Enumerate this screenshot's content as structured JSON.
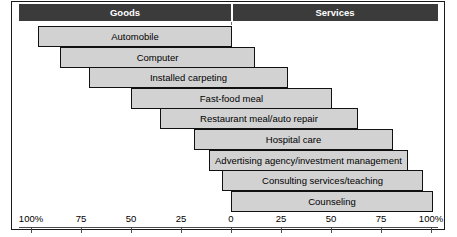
{
  "header": {
    "left_label": "Goods",
    "right_label": "Services"
  },
  "chart_data": {
    "type": "bar",
    "title": "",
    "subtitle": "",
    "xlabel": "",
    "ylabel": "",
    "orientation": "horizontal-diverging",
    "grid": false,
    "legend_position": "top",
    "legend": [
      "Goods",
      "Services"
    ],
    "axis": {
      "left_axis_label": "Goods",
      "right_axis_label": "Services",
      "tick_labels": [
        "100%",
        "75",
        "50",
        "25",
        "0",
        "25",
        "50",
        "75",
        "100%"
      ],
      "tick_values": [
        -100,
        -75,
        -50,
        -25,
        0,
        25,
        50,
        75,
        100
      ],
      "xlim": [
        -100,
        100
      ],
      "zero_position": 0
    },
    "categories": [
      "Automobile",
      "Computer",
      "Installed carpeting",
      "Fast-food meal",
      "Restaurant meal/auto repair",
      "Hospital care",
      "Advertising agency/investment management",
      "Consulting services/teaching",
      "Counseling"
    ],
    "series": [
      {
        "name": "Goods",
        "values": [
          96.5,
          85.5,
          71,
          50,
          35.5,
          18.5,
          11,
          4.5,
          0
        ]
      },
      {
        "name": "Services",
        "values": [
          3.5,
          14.5,
          29,
          50,
          64.5,
          81.5,
          89,
          95.5,
          100
        ]
      }
    ],
    "bars": [
      {
        "label": "Automobile",
        "goods_pct": 96.5,
        "services_pct": 3.5,
        "start": -96.5,
        "end": 0.5
      },
      {
        "label": "Computer",
        "goods_pct": 85.5,
        "services_pct": 14.5,
        "start": -85.5,
        "end": 12
      },
      {
        "label": "Installed carpeting",
        "goods_pct": 71,
        "services_pct": 29,
        "start": -71,
        "end": 28.5
      },
      {
        "label": "Fast-food meal",
        "goods_pct": 50,
        "services_pct": 50,
        "start": -50,
        "end": 50.5
      },
      {
        "label": "Restaurant meal/auto repair",
        "goods_pct": 35.5,
        "services_pct": 64.5,
        "start": -35.5,
        "end": 63.5
      },
      {
        "label": "Hospital care",
        "goods_pct": 18.5,
        "services_pct": 81.5,
        "start": -18.5,
        "end": 81
      },
      {
        "label": "Advertising agency/investment management",
        "goods_pct": 11,
        "services_pct": 89,
        "start": -11,
        "end": 88.5
      },
      {
        "label": "Consulting services/teaching",
        "goods_pct": 4.5,
        "services_pct": 95.5,
        "start": -4.5,
        "end": 96
      },
      {
        "label": "Counseling",
        "goods_pct": 0,
        "services_pct": 100,
        "start": 0,
        "end": 101
      }
    ],
    "colors": {
      "bar_fill": "#d2d2d2",
      "bar_border": "#111111",
      "header_bar": "#3b3b3b",
      "header_text": "#ffffff",
      "zero_line": "#6e6e6e",
      "axis": "#4a4a4a",
      "background": "#ffffff"
    }
  }
}
